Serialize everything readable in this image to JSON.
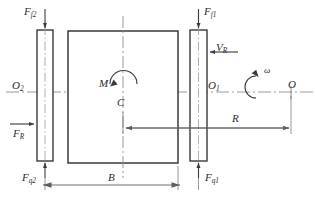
{
  "figure": {
    "type": "free-body-diagram",
    "title": "",
    "stroke_color": "#3a3a3a",
    "centerline_color": "#8a8a8a",
    "dimension_color": "#6a6a6a",
    "background": "#ffffff"
  },
  "labels": {
    "force_friction_left": {
      "base": "F",
      "sub": "f2"
    },
    "force_friction_right": {
      "base": "F",
      "sub": "f1"
    },
    "force_normal_left": {
      "base": "F",
      "sub": "q2"
    },
    "force_normal_right": {
      "base": "F",
      "sub": "q1"
    },
    "force_radial": {
      "base": "F",
      "sub": "R"
    },
    "velocity_radial": {
      "base": "V",
      "sub": "R"
    },
    "moment": {
      "base": "M",
      "sub": ""
    },
    "center": {
      "base": "C",
      "sub": ""
    },
    "origin_right": {
      "base": "O",
      "sub": "1"
    },
    "origin_left": {
      "base": "O",
      "sub": "2"
    },
    "origin_axis": {
      "base": "O",
      "sub": ""
    },
    "angular_velocity": {
      "base": "ω",
      "sub": ""
    },
    "radius": {
      "base": "R",
      "sub": ""
    },
    "width": {
      "base": "B",
      "sub": ""
    }
  },
  "geometry": {
    "center_block": {
      "x": 68,
      "y": 31,
      "width": 110,
      "height": 132
    },
    "left_pad": {
      "x": 37,
      "y": 30,
      "width": 16,
      "height": 131
    },
    "right_pad": {
      "x": 190,
      "y": 30,
      "width": 17,
      "height": 131
    },
    "horizontal_axis_y": 92,
    "vertical_centerline_x": 123,
    "dimension_R_y": 128,
    "dimension_B_y": 185,
    "point_O_x": 291
  }
}
